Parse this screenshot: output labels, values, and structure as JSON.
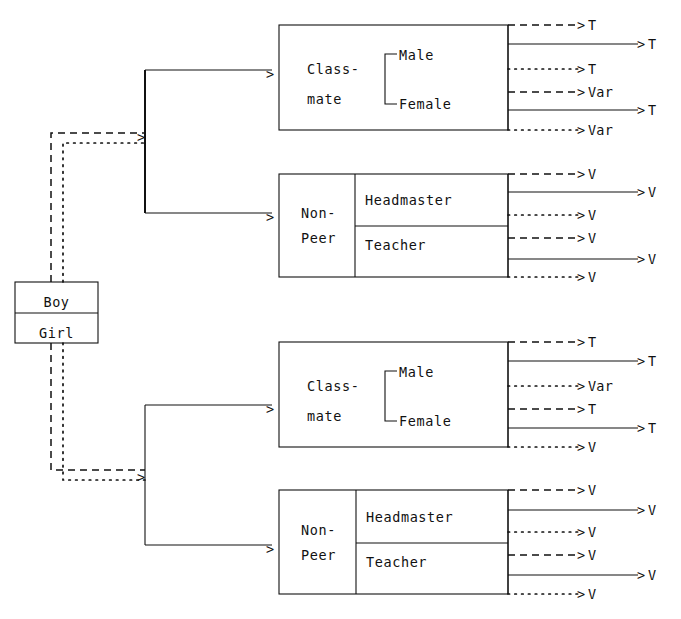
{
  "diagram": {
    "root": {
      "name": "root-box",
      "rows": [
        {
          "label": "Boy",
          "line_style": "dashed"
        },
        {
          "label": "Girl",
          "line_style": "dotted"
        }
      ]
    },
    "groups": [
      {
        "id": "upper",
        "branch_style": "solid",
        "nodes": [
          {
            "id": "classmate-upper",
            "label_line1": "Class-",
            "label_line2": "mate",
            "sub_labels": [
              "Male",
              "Female"
            ],
            "sub_bracket": true,
            "outputs": [
              {
                "style": "dashed",
                "length": "short",
                "label": "T"
              },
              {
                "style": "solid",
                "length": "long",
                "label": "T"
              },
              {
                "style": "dotted",
                "length": "short",
                "label": "T"
              },
              {
                "style": "dashed",
                "length": "short",
                "label": "Var"
              },
              {
                "style": "solid",
                "length": "long",
                "label": "T"
              },
              {
                "style": "dotted",
                "length": "short",
                "label": "Var"
              }
            ]
          },
          {
            "id": "nonpeer-upper",
            "label_line1": "Non-",
            "label_line2": "Peer",
            "sub_labels": [
              "Headmaster",
              "Teacher"
            ],
            "sub_bracket": false,
            "outputs": [
              {
                "style": "dashed",
                "length": "short",
                "label": "V"
              },
              {
                "style": "solid",
                "length": "long",
                "label": "V"
              },
              {
                "style": "dotted",
                "length": "short",
                "label": "V"
              },
              {
                "style": "dashed",
                "length": "short",
                "label": "V"
              },
              {
                "style": "solid",
                "length": "long",
                "label": "V"
              },
              {
                "style": "dotted",
                "length": "short",
                "label": "V"
              }
            ]
          }
        ]
      },
      {
        "id": "lower",
        "branch_style": "solid",
        "nodes": [
          {
            "id": "classmate-lower",
            "label_line1": "Class-",
            "label_line2": "mate",
            "sub_labels": [
              "Male",
              "Female"
            ],
            "sub_bracket": true,
            "outputs": [
              {
                "style": "dashed",
                "length": "short",
                "label": "T"
              },
              {
                "style": "solid",
                "length": "long",
                "label": "T"
              },
              {
                "style": "dotted",
                "length": "short",
                "label": "Var"
              },
              {
                "style": "dashed",
                "length": "short",
                "label": "T"
              },
              {
                "style": "solid",
                "length": "long",
                "label": "T"
              },
              {
                "style": "dotted",
                "length": "short",
                "label": "V"
              }
            ]
          },
          {
            "id": "nonpeer-lower",
            "label_line1": "Non-",
            "label_line2": "Peer",
            "sub_labels": [
              "Headmaster",
              "Teacher"
            ],
            "sub_bracket": false,
            "outputs": [
              {
                "style": "dashed",
                "length": "short",
                "label": "V"
              },
              {
                "style": "solid",
                "length": "long",
                "label": "V"
              },
              {
                "style": "dotted",
                "length": "short",
                "label": "V"
              },
              {
                "style": "dashed",
                "length": "short",
                "label": "V"
              },
              {
                "style": "solid",
                "length": "long",
                "label": "V"
              },
              {
                "style": "dotted",
                "length": "short",
                "label": "V"
              }
            ]
          }
        ]
      }
    ],
    "arrow_glyph": ">",
    "colors": {
      "ink": "#111111",
      "background": "#ffffff"
    }
  }
}
